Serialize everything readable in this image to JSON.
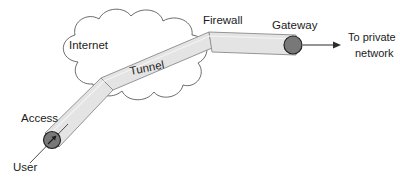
{
  "diagram": {
    "background_color": "#ffffff",
    "labels": {
      "internet": "Internet",
      "tunnel": "Tunnel",
      "firewall": "Firewall",
      "gateway": "Gateway",
      "access": "Access",
      "user": "User",
      "destination_line1": "To private",
      "destination_line2": "network"
    },
    "colors": {
      "outline": "#4a4a4a",
      "tunnel_fill": "#e4e4e4",
      "tunnel_edge": "#8a8a8a",
      "node_fill": "#787878",
      "node_outline": "#2b2b2b",
      "text": "#1c1c1c",
      "cloud_fill": "#ffffff"
    },
    "nodes": [
      {
        "name": "access-point",
        "label": "Access",
        "shape": "circle",
        "cx": 52,
        "cy": 140,
        "r": 8.5
      },
      {
        "name": "gateway",
        "label": "Gateway",
        "shape": "circle",
        "cx": 293,
        "cy": 45,
        "r": 9
      }
    ],
    "cloud": {
      "name": "internet-cloud",
      "label": "Internet"
    },
    "tunnel": {
      "name": "vpn-tunnel",
      "label": "Tunnel",
      "label_rotation_deg": -11,
      "path_points": "52,140 107,85 212,40 293,45"
    },
    "arrows": [
      {
        "name": "user-arrow",
        "from": "User",
        "direction": "up-right"
      },
      {
        "name": "private-network-arrow",
        "from": "Gateway",
        "direction": "right"
      }
    ]
  }
}
